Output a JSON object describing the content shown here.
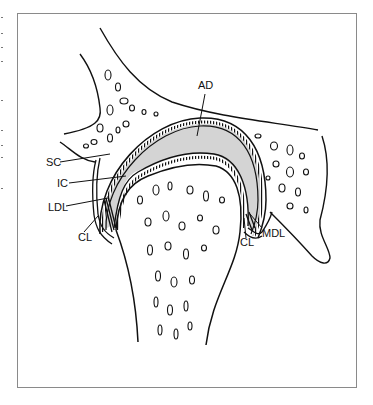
{
  "figure": {
    "type": "anatomical-diagram",
    "labels": [
      {
        "id": "AD",
        "text": "AD",
        "x": 198,
        "y": 89
      },
      {
        "id": "SC",
        "text": "SC",
        "x": 46,
        "y": 166
      },
      {
        "id": "IC",
        "text": "IC",
        "x": 57,
        "y": 187
      },
      {
        "id": "LDL",
        "text": "LDL",
        "x": 48,
        "y": 211
      },
      {
        "id": "CL_left",
        "text": "CL",
        "x": 78,
        "y": 241
      },
      {
        "id": "MDL",
        "text": "MDL",
        "x": 262,
        "y": 237
      },
      {
        "id": "CL_right",
        "text": "CL",
        "x": 240,
        "y": 246
      }
    ],
    "colors": {
      "line": "#111111",
      "fill_gray": "#d4d4d4",
      "frame": "#8a8a8a",
      "background": "#ffffff"
    }
  }
}
